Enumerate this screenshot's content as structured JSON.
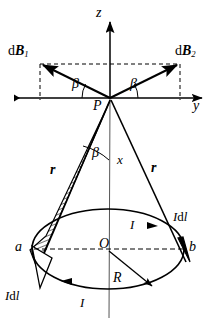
{
  "figure": {
    "type": "physics-vector-diagram",
    "width": 210,
    "height": 326,
    "stroke_color": "#000000",
    "background_color": "#ffffff"
  },
  "axes": {
    "z_label": "z",
    "y_label": "y",
    "x_label": "x",
    "origin_label": "P",
    "center_label": "O"
  },
  "vectors": {
    "dB1_label_prefix": "d",
    "dB1_label_symbol": "B",
    "dB1_label_sub": "1",
    "dB2_label_prefix": "d",
    "dB2_label_symbol": "B",
    "dB2_label_sub": "2",
    "r_left_label": "r",
    "r_right_label": "r"
  },
  "angles": {
    "beta_left": "β",
    "beta_right": "β",
    "beta_axis": "β"
  },
  "loop": {
    "radius_label": "R",
    "current_label_left": "I",
    "current_label_right": "I",
    "point_a_label": "a",
    "point_b_label": "b",
    "element_left_current": "I",
    "element_left_diff": "d",
    "element_left_length": "l",
    "element_right_current": "I",
    "element_right_diff": "d",
    "element_right_length": "l"
  },
  "geometry": {
    "origin_x": 110,
    "origin_y": 98,
    "center_x": 108,
    "center_y": 249,
    "ellipse_rx": 76,
    "ellipse_ry": 40,
    "dB1_x": 36,
    "dB1_y": 59,
    "dB2_x": 184,
    "dB2_y": 59
  }
}
